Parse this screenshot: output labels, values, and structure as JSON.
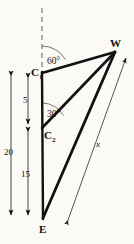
{
  "figure": {
    "type": "geometry-diagram",
    "background_color": "#fbfaf7",
    "ink_color": "#111111",
    "thin_color": "#555555",
    "points": [
      {
        "id": "C1",
        "base": "C",
        "sub": "1",
        "x": 42,
        "y": 73
      },
      {
        "id": "C2",
        "base": "C",
        "sub": "2",
        "x": 42,
        "y": 128
      },
      {
        "id": "E",
        "base": "E",
        "sub": "",
        "x": 43,
        "y": 218
      },
      {
        "id": "W",
        "base": "W",
        "sub": "",
        "x": 115,
        "y": 52
      }
    ],
    "point_labels": [
      {
        "name": "label-C1",
        "base": "C",
        "sub": "1",
        "left": 31,
        "top": 67
      },
      {
        "name": "label-C2",
        "base": "C",
        "sub": "2",
        "left": 44,
        "top": 130
      },
      {
        "name": "label-E",
        "base": "E",
        "sub": "",
        "left": 39,
        "top": 224
      },
      {
        "name": "label-W",
        "base": "W",
        "sub": "",
        "left": 110,
        "top": 38
      }
    ],
    "angles": [
      {
        "name": "angle-60",
        "label": "60°",
        "vertex": "C1",
        "value": 60,
        "left": 47,
        "top": 57
      },
      {
        "name": "angle-30",
        "label": "30°",
        "vertex": "C2",
        "value": 30,
        "left": 47,
        "top": 110
      }
    ],
    "dimensions": [
      {
        "name": "dimension-20",
        "label": "20",
        "from": "C1",
        "to": "E",
        "value": 20,
        "left": 4,
        "top": 148
      },
      {
        "name": "dimension-5",
        "label": "5",
        "from": "C1",
        "to": "C2",
        "value": 5,
        "left": 22,
        "top": 96
      },
      {
        "name": "dimension-15",
        "label": "15",
        "from": "C2",
        "to": "E",
        "value": 15,
        "left": 22,
        "top": 170
      },
      {
        "name": "dimension-x",
        "label": "x",
        "from": "E",
        "to": "W",
        "value": "x",
        "left": 96,
        "top": 140
      }
    ],
    "segments": [
      {
        "name": "segment-c1-w",
        "from": "C1",
        "to": "W"
      },
      {
        "name": "segment-c2-w",
        "from": "C2",
        "to": "W"
      },
      {
        "name": "segment-e-w",
        "from": "E",
        "to": "W"
      },
      {
        "name": "segment-c1-e",
        "from": "C1",
        "to": "E"
      }
    ],
    "dashed_line": {
      "name": "vertical-reference-dashed-line",
      "x": 42,
      "y1": 8,
      "y2": 70
    }
  }
}
